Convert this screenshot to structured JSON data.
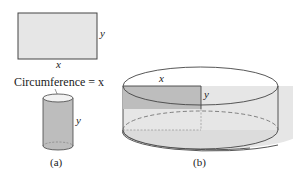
{
  "figure_a": {
    "rectangle": {
      "width_label": "x",
      "height_label": "y"
    },
    "circumference_label": "Circumference = x",
    "cylinder": {
      "height_label": "y"
    },
    "caption": "(a)"
  },
  "figure_b": {
    "radius_label": "x",
    "height_label": "y",
    "caption": "(b)"
  },
  "colors": {
    "fill_light": "#e6e6e6",
    "fill_dark": "#bdbdbd",
    "stroke": "#444444"
  }
}
